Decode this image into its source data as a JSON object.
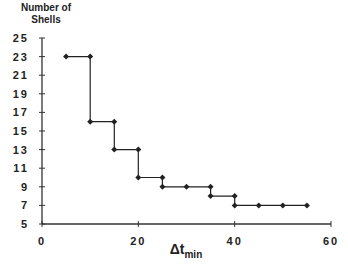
{
  "chart_data": {
    "type": "line",
    "style": "step",
    "title": "",
    "xlabel": "Δt_min",
    "xlabel_main": "Δt",
    "xlabel_sub": "min",
    "ylabel_line1": "Number of",
    "ylabel_line2": "Shells",
    "ylabel": "Number of Shells",
    "xlim": [
      0,
      60
    ],
    "ylim": [
      5,
      25
    ],
    "x_ticks": [
      0,
      20,
      40,
      60
    ],
    "y_ticks": [
      5,
      7,
      9,
      11,
      13,
      15,
      17,
      19,
      21,
      23,
      25
    ],
    "grid": false,
    "legend": null,
    "series": [
      {
        "name": "Number of Shells",
        "color": "#222222",
        "marker": "diamond",
        "points": [
          [
            5,
            23
          ],
          [
            10,
            23
          ],
          [
            10,
            16
          ],
          [
            15,
            16
          ],
          [
            15,
            13
          ],
          [
            20,
            13
          ],
          [
            20,
            10
          ],
          [
            25,
            10
          ],
          [
            25,
            9
          ],
          [
            30,
            9
          ],
          [
            35,
            9
          ],
          [
            35,
            8
          ],
          [
            40,
            8
          ],
          [
            40,
            7
          ],
          [
            45,
            7
          ],
          [
            50,
            7
          ],
          [
            55,
            7
          ]
        ]
      }
    ]
  }
}
